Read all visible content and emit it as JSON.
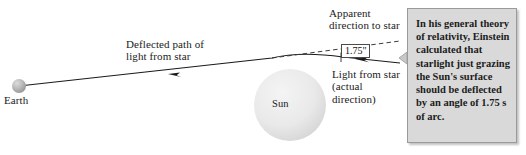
{
  "figure": {
    "background_color": "#ffffff"
  },
  "bodies": {
    "earth": {
      "label": "Earth",
      "cx": 19,
      "cy": 86,
      "r": 7,
      "color": "#b0b0b0"
    },
    "sun": {
      "label": "Sun",
      "cx": 290,
      "cy": 105,
      "r": 36,
      "color": "#e8e8e8"
    }
  },
  "annotations": {
    "deflected_path": "Deflected path of\nlight from star",
    "apparent_direction": "Apparent\ndirection to star",
    "actual_direction": "Light from star\n(actual\ndirection)",
    "angle_value": "1.75\""
  },
  "callout": {
    "text": "In his general theory of relativity, Einstein calculated that starlight just grazing the Sun's surface should be deflected by an angle of 1.75 s of arc.",
    "background_color": "#d9d9d9",
    "border_color": "#9a9a9a"
  },
  "style": {
    "line_color": "#1a1a1a",
    "dash_color": "#3a3a3a",
    "text_color": "#1a1a1a"
  }
}
